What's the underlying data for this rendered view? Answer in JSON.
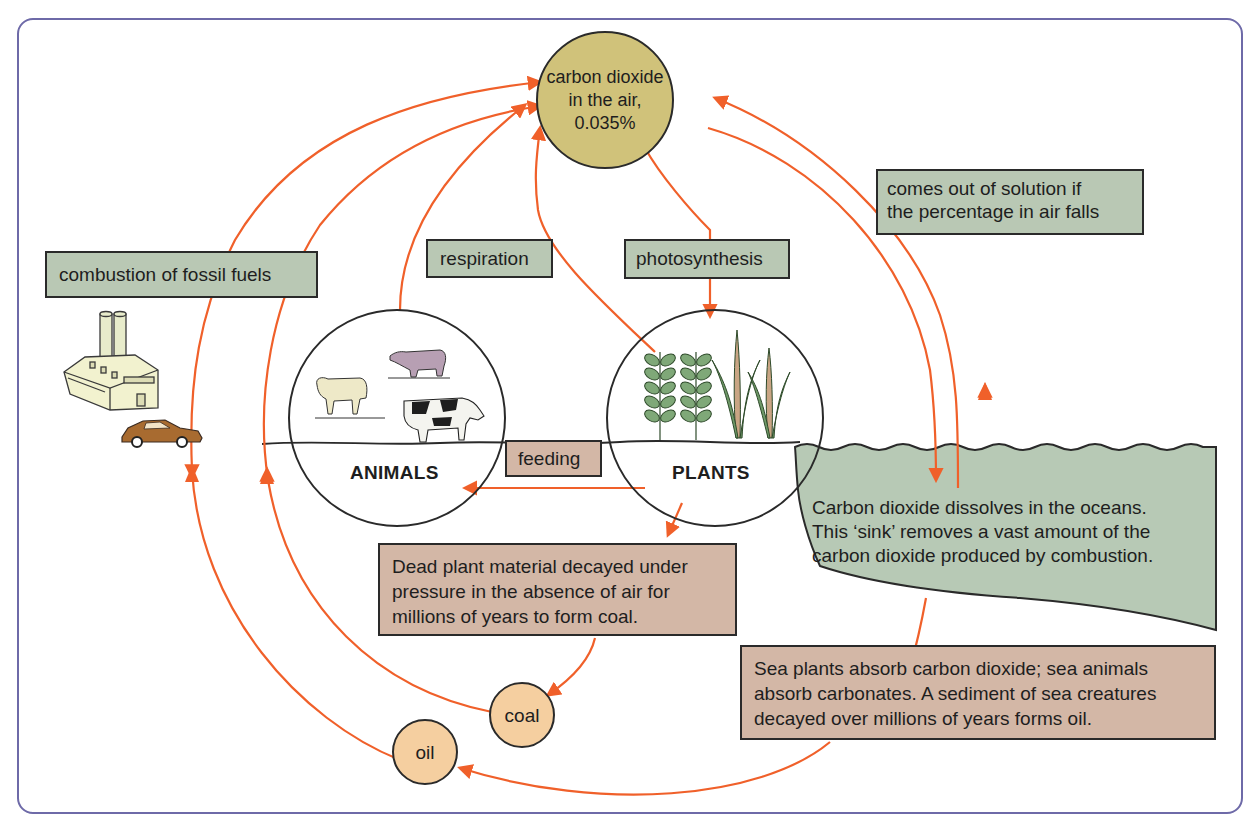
{
  "colors": {
    "arrow": "#f0602a",
    "frame": "#6e6aa8",
    "co2_circle_fill": "#d0c27a",
    "fossil_circle_fill": "#f5cfa0",
    "green_box_fill": "#b9c8b4",
    "brown_box_fill": "#d3b7a6",
    "ocean_fill": "#b7c9b5"
  },
  "co2": {
    "line1": "carbon dioxide",
    "line2": "in the air,",
    "line3": "0.035%"
  },
  "labels": {
    "combustion": "combustion of fossil fuels",
    "respiration": "respiration",
    "photosynthesis": "photosynthesis",
    "out_of_solution_line1": "comes out of solution if",
    "out_of_solution_line2": "the percentage in air falls",
    "feeding": "feeding",
    "animals": "ANIMALS",
    "plants": "PLANTS",
    "coal": "coal",
    "oil": "oil"
  },
  "ocean": {
    "line1": "Carbon dioxide dissolves in the oceans.",
    "line2": "This ‘sink’ removes a vast amount of the",
    "line3": "carbon dioxide produced by combustion."
  },
  "coal_box": {
    "line1": "Dead plant material decayed under",
    "line2": "pressure in the absence of air for",
    "line3": "millions of years to form coal."
  },
  "oil_box": {
    "line1": "Sea plants absorb carbon dioxide; sea animals",
    "line2": "absorb carbonates. A sediment of sea creatures",
    "line3": "decayed over millions of years forms oil."
  },
  "icons": {
    "factory": "factory-icon",
    "car": "car-icon",
    "pig": "pig-icon",
    "sheep": "sheep-icon",
    "cow": "cow-icon",
    "leafy_plant": "leafy-plant-icon",
    "grass_plant": "grass-plant-icon"
  }
}
